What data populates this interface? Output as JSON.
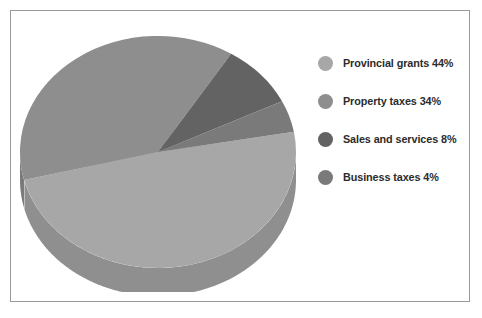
{
  "figure": {
    "background_color": "#ffffff",
    "frame_color": "#9a9a9a"
  },
  "chart_data": {
    "type": "pie",
    "title": "",
    "xlabel": "",
    "ylabel": "",
    "style": "3d-extruded",
    "legend_position": "right",
    "grid": false,
    "start_angle_deg": -10,
    "direction": "clockwise",
    "categories": [
      "Provincial grants",
      "Property taxes",
      "Sales and services",
      "Business taxes"
    ],
    "values": [
      44,
      34,
      8,
      4
    ],
    "value_unit": "%",
    "labels": [
      "Provincial grants 44%",
      "Property taxes 34%",
      "Sales and services 8%",
      "Business taxes 4%"
    ],
    "colors": [
      "#a7a7a7",
      "#8e8e8e",
      "#636363",
      "#7a7a7a"
    ],
    "side_colors": [
      "#8f8f8f",
      "#7a7a7a",
      "#4f4f4f",
      "#656565"
    ]
  },
  "legend": {
    "items": [
      {
        "label": "Provincial grants 44%",
        "swatch_color": "#a7a7a7",
        "name": "provincial-grants"
      },
      {
        "label": "Property taxes 34%",
        "swatch_color": "#8e8e8e",
        "name": "property-taxes"
      },
      {
        "label": "Sales and services 8%",
        "swatch_color": "#636363",
        "name": "sales-and-services"
      },
      {
        "label": "Business taxes 4%",
        "swatch_color": "#7a7a7a",
        "name": "business-taxes"
      }
    ]
  }
}
